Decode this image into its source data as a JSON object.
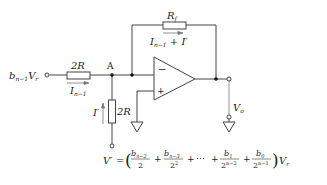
{
  "diagram": {
    "type": "op-amp inverting summing circuit (R-2R DAC stage)",
    "input": {
      "label_main": "b",
      "label_sub": "n−1",
      "label_tail": "V",
      "label_tail_sub": "r"
    },
    "series_resistor": {
      "label": "2R"
    },
    "series_current": {
      "label_main": "I",
      "label_sub": "n−1"
    },
    "node": {
      "label": "A"
    },
    "feedback_resistor": {
      "label_main": "R",
      "label_sub": "f"
    },
    "feedback_current": {
      "label_main": "I",
      "label_sub": "n−1",
      "label_tail": " + I′"
    },
    "shunt_resistor": {
      "label": "2R"
    },
    "shunt_current": {
      "label": "I′"
    },
    "opamp": {
      "minus": "−",
      "plus": "+"
    },
    "output": {
      "label_main": "V",
      "label_sub": "o"
    },
    "equation": {
      "lhs": "V′",
      "eq": "=",
      "terms": [
        {
          "num": "b",
          "num_sub": "n−2",
          "den": "2",
          "den_sup": ""
        },
        {
          "num": "b",
          "num_sub": "n−3",
          "den": "2",
          "den_sup": "2"
        },
        {
          "num": "",
          "num_sub": "",
          "den": "",
          "den_sup": "",
          "ellipsis": "⋯"
        },
        {
          "num": "b",
          "num_sub": "1",
          "den": "2",
          "den_sup": "n−2"
        },
        {
          "num": "b",
          "num_sub": "0",
          "den": "2",
          "den_sup": "n−1"
        }
      ],
      "plus": "+",
      "rhs_tail": "V",
      "rhs_tail_sub": "r"
    }
  }
}
